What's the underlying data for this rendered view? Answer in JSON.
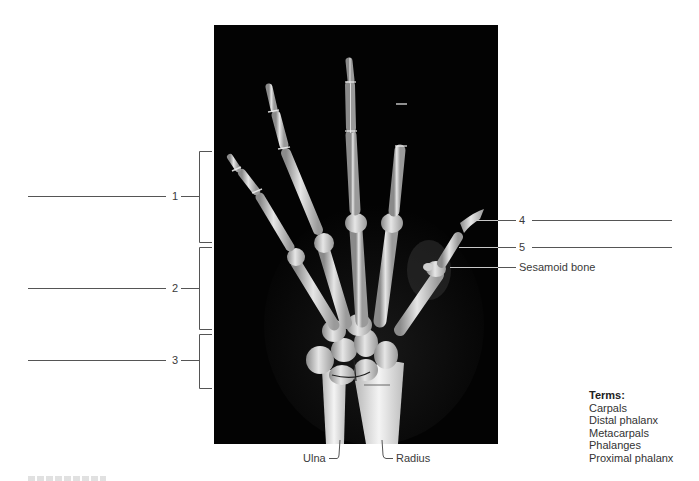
{
  "figure": {
    "type": "hand-xray-labeling-exercise",
    "image": {
      "subject": "x-ray of right hand and wrist, posterior view",
      "background": "#030303"
    }
  },
  "left_labels": [
    {
      "number": "1",
      "answer_value": ""
    },
    {
      "number": "2",
      "answer_value": ""
    },
    {
      "number": "3",
      "answer_value": ""
    }
  ],
  "right_labels": [
    {
      "number": "4",
      "answer_value": ""
    },
    {
      "number": "5",
      "answer_value": ""
    },
    {
      "text": "Sesamoid bone"
    }
  ],
  "bottom_labels": {
    "ulna": "Ulna",
    "radius": "Radius"
  },
  "terms": {
    "title": "Terms:",
    "items": [
      "Carpals",
      "Distal phalanx",
      "Metacarpals",
      "Phalanges",
      "Proximal phalanx"
    ]
  },
  "colors": {
    "line": "#555555",
    "leader_on_xray": "#c8c8c8",
    "text": "#333333"
  }
}
